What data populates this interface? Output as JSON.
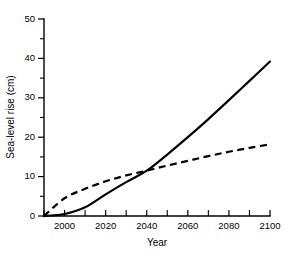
{
  "chart_data": {
    "type": "line",
    "title": "",
    "xlabel": "Year",
    "ylabel": "Sea-level rise (cm)",
    "xlim": [
      1990,
      2100
    ],
    "ylim": [
      0,
      50
    ],
    "grid": false,
    "legend": "none",
    "x_major_ticks": [
      2000,
      2020,
      2040,
      2060,
      2080,
      2100
    ],
    "x_minor_ticks": [
      1990,
      2010,
      2030,
      2050,
      2070,
      2090
    ],
    "x_ticklabels": [
      "2000",
      "2020",
      "2040",
      "2060",
      "2080",
      "2100"
    ],
    "y_major_ticks": [
      0,
      10,
      20,
      30,
      40,
      50
    ],
    "y_minor_ticks": [
      5,
      15,
      25,
      35,
      45
    ],
    "y_ticklabels": [
      "0",
      "10",
      "20",
      "30",
      "40",
      "50"
    ],
    "x": [
      1990,
      2000,
      2010,
      2020,
      2030,
      2040,
      2050,
      2060,
      2070,
      2080,
      2090,
      2100
    ],
    "series": [
      {
        "name": "accelerating-scenario",
        "style": "solid",
        "color": "#000000",
        "values": [
          0,
          0.5,
          2.2,
          5.5,
          8.6,
          11.5,
          15.6,
          20.0,
          24.6,
          29.4,
          34.3,
          39.2
        ]
      },
      {
        "name": "decelerating-scenario",
        "style": "dashed",
        "color": "#000000",
        "values": [
          0,
          4.5,
          6.9,
          8.8,
          10.3,
          11.5,
          12.8,
          14.0,
          15.2,
          16.3,
          17.3,
          18.2
        ]
      }
    ]
  },
  "axes": {
    "y_title": "Sea-level rise (cm)",
    "x_title": "Year"
  },
  "colors": {
    "background": "#ffffff",
    "ink": "#000000"
  }
}
